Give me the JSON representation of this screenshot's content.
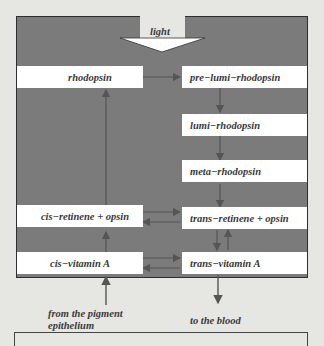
{
  "diagram": {
    "title_arrow_label": "light",
    "left_column": [
      {
        "id": "rhodopsin",
        "label": "rhodopsin"
      },
      {
        "id": "cis-retinene-opsin",
        "label": "cis−retinene + opsin"
      },
      {
        "id": "cis-vitamin-a",
        "label": "cis−vitamin A"
      }
    ],
    "right_column": [
      {
        "id": "pre-lumi-rhodopsin",
        "label": "pre−lumi−rhodopsin"
      },
      {
        "id": "lumi-rhodopsin",
        "label": "lumi−rhodopsin"
      },
      {
        "id": "meta-rhodopsin",
        "label": "meta−rhodopsin"
      },
      {
        "id": "trans-retinene-opsin",
        "label": "trans−retinene + opsin"
      },
      {
        "id": "trans-vitamin-a",
        "label": "trans−vitamin A"
      }
    ],
    "external_inputs": {
      "from": "from the pigment epithelium",
      "from_line1": "from the pigment",
      "from_line2": "epithelium",
      "to": "to the blood"
    },
    "colors": {
      "panel": "#7b7b7b",
      "box": "#ffffff",
      "arrow": "#555555",
      "background": "#e6e6e2",
      "text": "#3a3a3a"
    }
  }
}
